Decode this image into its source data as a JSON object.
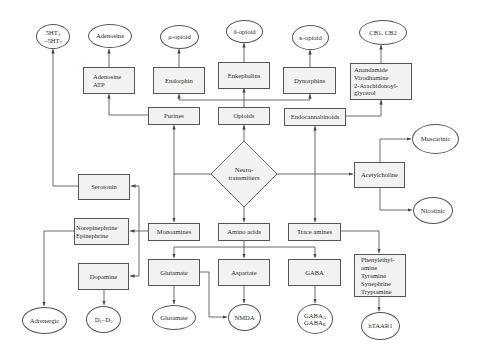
{
  "diagram": {
    "center": {
      "label_line1": "Neuro-",
      "label_line2": "transmitters"
    },
    "categories": {
      "purines": "Purines",
      "opioids": "Opioids",
      "endocannabinoids": "Endocannabinoids",
      "acetylcholine": "Acetylcholine",
      "monoamines": "Monoamines",
      "amino_acids": "Amino acids",
      "trace_amines": "Trace amines"
    },
    "transmitters": {
      "adenosine_atp": "Adenosine\nATP",
      "endorphin": "Endorphin",
      "enkephalins": "Enkephalins",
      "dynorphins": "Dynorphins",
      "endocannabinoid_list": "Anandamide\nVirodhamine\n2-Arachidonoyl-\nglycerol",
      "serotonin": "Serotonin",
      "norepinephrine": "Norepinephrine\nEpinephrine",
      "dopamine": "Dopamine",
      "glutamate": "Glutamate",
      "aspartate": "Aspartate",
      "gaba": "GABA",
      "trace_amine_list": "Phenylethyl-\namine\nTyramine\nSynephrine\nTryptamine"
    },
    "receptors": {
      "serotonin_r_a": "5HT",
      "serotonin_r_a_sub": "1",
      "serotonin_r_b": "–5HT",
      "serotonin_r_b_sub": "7",
      "adenosine": "Adenosine",
      "mu_opioid": "μ-opioid",
      "delta_opioid": "δ-opioid",
      "kappa_opioid": "κ-opioid",
      "cannabinoid": "CB1, CB2",
      "muscarinic": "Muscarinic",
      "nicotinic": "Nicotinic",
      "adrenergic": "Adrenergic",
      "dopamine_r_a": "D",
      "dopamine_r_a_sub": "1",
      "dopamine_r_b": "–D",
      "dopamine_r_b_sub": "5",
      "glutamate": "Glutamate",
      "nmda": "NMDA",
      "gaba_a": "GABA",
      "gaba_a_sub": "A",
      "gaba_b": "GABA",
      "gaba_b_sub": "B",
      "htaar1": "hTAAR1"
    },
    "colors": {
      "line": "#444444",
      "box_fill": "#f2f2f2",
      "border": "#555555"
    }
  }
}
